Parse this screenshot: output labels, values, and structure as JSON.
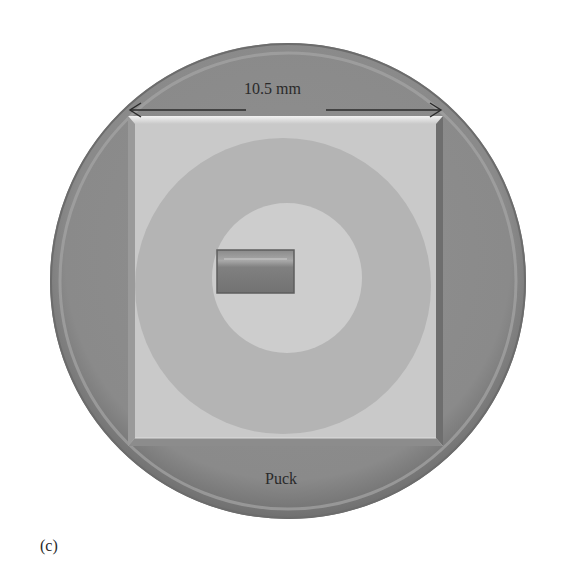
{
  "figure": {
    "panel_label": "(c)",
    "dimension_label": "10.5 mm",
    "puck_label": "Puck",
    "colors": {
      "background": "#ffffff",
      "puck_outer": "#8a8a8a",
      "puck_rim_highlight": "#a8a8a8",
      "square_plate": "#c9c9c9",
      "square_bevel_light": "#e6e6e6",
      "square_bevel_dark": "#6e6e6e",
      "outer_ring": "#b4b4b4",
      "inner_disc": "#cdcdcd",
      "center_chip": "#7c7c7c",
      "text": "#2a2a2a"
    }
  }
}
